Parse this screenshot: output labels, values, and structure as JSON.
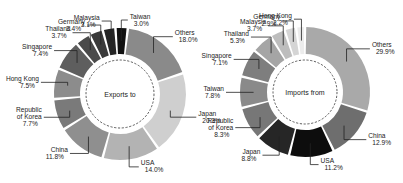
{
  "chart_data": [
    {
      "type": "pie",
      "subtype": "donut",
      "title": "Exports to",
      "center_label": "Exports to",
      "unit": "%",
      "categories": [
        "Taiwan",
        "Others",
        "Japan",
        "USA",
        "China",
        "Republic of Korea",
        "Hong Kong",
        "Singapore",
        "Thailand",
        "Germany",
        "Malaysia"
      ],
      "values": [
        3.0,
        18.0,
        20.3,
        14.0,
        11.8,
        7.7,
        7.5,
        7.4,
        3.7,
        3.4,
        3.1
      ],
      "labels": [
        "Taiwan\n3.0%",
        "Others\n18.0%",
        "Japan\n20.3%",
        "USA\n14.0%",
        "China\n11.8%",
        "Republic\nof Korea\n7.7%",
        "Hong Kong\n7.5%",
        "Singapore\n7.4%",
        "Thailand\n3.7%",
        "Germany\n3.4%",
        "Malaysia\n3.1%"
      ],
      "colors": [
        "#111111",
        "#8a8a8a",
        "#cfcfcf",
        "#b3b3b3",
        "#8f8f8f",
        "#7a7a7a",
        "#8c8c8c",
        "#5e5e5e",
        "#4a4a4a",
        "#3a3a3a",
        "#252525"
      ],
      "legend": "none (leader-line labels)"
    },
    {
      "type": "pie",
      "subtype": "donut",
      "title": "Imports from",
      "center_label": "Imports from",
      "unit": "%",
      "categories": [
        "Others",
        "China",
        "USA",
        "Japan",
        "Republic of Korea",
        "Taiwan",
        "Singapore",
        "Thailand",
        "Malaysia",
        "Germany",
        "Hong Kong"
      ],
      "values": [
        29.9,
        12.9,
        11.2,
        8.8,
        8.3,
        7.8,
        7.1,
        5.3,
        3.7,
        2.9,
        2.2
      ],
      "labels": [
        "Others\n29.9%",
        "China\n12.9%",
        "USA\n11.2%",
        "Japan\n8.8%",
        "Republic\nof Korea\n8.3%",
        "Taiwan\n7.8%",
        "Singapore\n7.1%",
        "Thailand\n5.3%",
        "Malaysia\n3.7%",
        "Germany\n2.9%",
        "Hong Kong\n2.2%"
      ],
      "colors": [
        "#a9a9a9",
        "#6e6e6e",
        "#0d0d0d",
        "#262626",
        "#777777",
        "#8a8a8a",
        "#7e7e7e",
        "#a5a5a5",
        "#bdbdbd",
        "#d5d5d5",
        "#ececec"
      ],
      "legend": "none (leader-line labels)"
    }
  ]
}
